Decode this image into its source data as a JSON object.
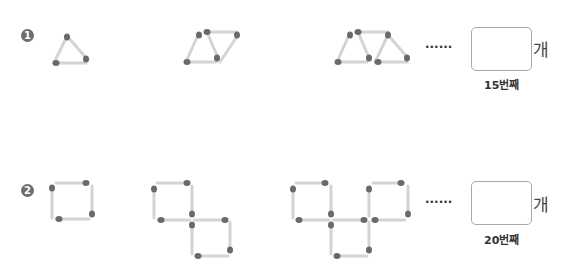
{
  "problems": [
    {
      "number": "1",
      "shape": "triangle",
      "figures": [
        "1 triangle (3 matchsticks)",
        "2 triangles (5 matchsticks)",
        "3 triangles (7 matchsticks)"
      ],
      "ellipsis": "······",
      "answer_value": "",
      "unit": "개",
      "caption": "15번째"
    },
    {
      "number": "2",
      "shape": "square",
      "figures": [
        "1 square (4 matchsticks)",
        "2 squares (7 matchsticks)",
        "3 squares (10 matchsticks)"
      ],
      "ellipsis": "······",
      "answer_value": "",
      "unit": "개",
      "caption": "20번째"
    }
  ],
  "colors": {
    "stick": "#d4d4d4",
    "head": "#6a6a6a",
    "badge": "#6e6e6e"
  }
}
